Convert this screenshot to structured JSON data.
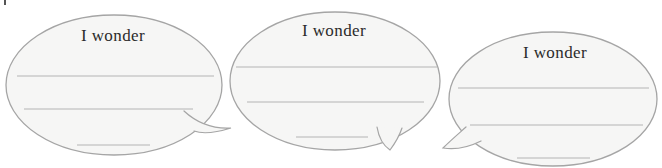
{
  "bubbles": [
    {
      "label": "I wonder",
      "tail": "bottom-right",
      "blank_lines": 3
    },
    {
      "label": "I wonder",
      "tail": "bottom-right",
      "blank_lines": 3
    },
    {
      "label": "I wonder",
      "tail": "bottom-left",
      "blank_lines": 3
    }
  ],
  "colors": {
    "background": "#ffffff",
    "bubble_fill": "#f6f6f5",
    "bubble_outline": "#a5a5a5",
    "writing_line": "#b4b4b4",
    "label_text": "#2b2b2b"
  }
}
